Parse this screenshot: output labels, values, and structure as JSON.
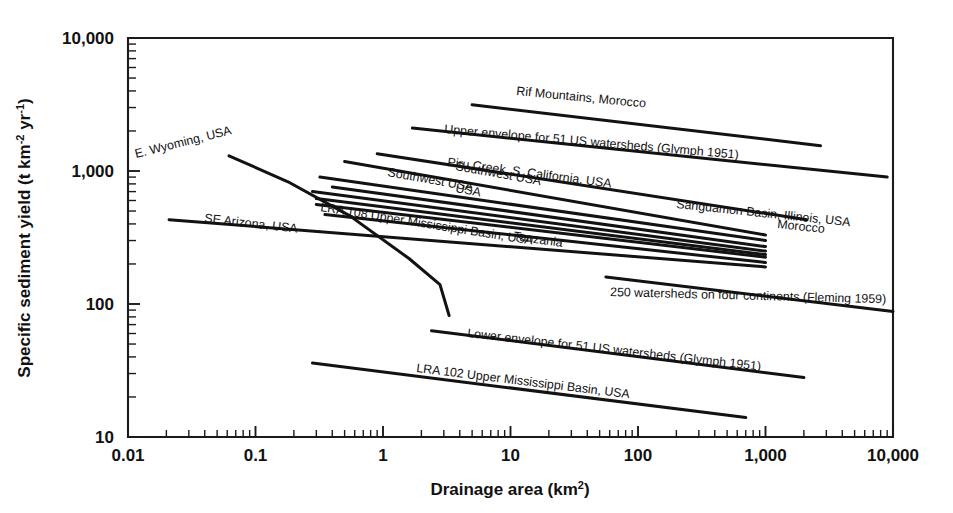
{
  "figure": {
    "title": "",
    "background": "#ffffff",
    "ink_color": "#121212"
  },
  "axes": {
    "x": {
      "label_prefix": "Drainage area (km",
      "label_sup": "2",
      "label_suffix": ")",
      "label_full": "Drainage area (km2)",
      "scale": "log",
      "min": 0.01,
      "max": 10000,
      "ticks": [
        {
          "value": 0.01,
          "label": "0.01"
        },
        {
          "value": 0.1,
          "label": "0.1"
        },
        {
          "value": 1,
          "label": "1"
        },
        {
          "value": 10,
          "label": "10"
        },
        {
          "value": 100,
          "label": "100"
        },
        {
          "value": 1000,
          "label": "1,000"
        },
        {
          "value": 10000,
          "label": "10,000"
        }
      ]
    },
    "y": {
      "label_part1": "Specific sediment yield (t km",
      "label_sup1": "-2",
      "label_part2": " yr",
      "label_sup2": "-1",
      "label_part3": ")",
      "label_full": "Specific sediment yield (t km-2 yr-1)",
      "scale": "log",
      "min": 10,
      "max": 10000,
      "ticks": [
        {
          "value": 10,
          "label": "10"
        },
        {
          "value": 100,
          "label": "100"
        },
        {
          "value": 1000,
          "label": "1,000"
        },
        {
          "value": 10000,
          "label": "10,000"
        }
      ]
    }
  },
  "chart_data": {
    "type": "line",
    "title": "",
    "xlabel": "Drainage area (km2)",
    "ylabel": "Specific sediment yield (t km-2 yr-1)",
    "xscale": "log",
    "yscale": "log",
    "xlim": [
      0.01,
      10000
    ],
    "ylim": [
      10,
      10000
    ],
    "grid": false,
    "legend": "inline-labels",
    "series": [
      {
        "name": "Rif Mountains, Morocco",
        "label": "Rif Mountains, Morocco",
        "label_angle": 5.5,
        "label_x": 516,
        "label_y": 95,
        "points": [
          [
            5.0,
            3150
          ],
          [
            2700,
            1550
          ]
        ]
      },
      {
        "name": "Upper envelope for 51 US watersheds (Glymph 1951)",
        "label": "Upper envelope for 51 US watersheds (Glymph 1951)",
        "label_angle": 5.0,
        "label_x": 444,
        "label_y": 133,
        "points": [
          [
            1.7,
            2100
          ],
          [
            9000,
            900
          ]
        ]
      },
      {
        "name": "Piru Creek, S. California, USA",
        "label": "Piru Creek, S. California, USA",
        "label_angle": 7.5,
        "label_x": 447,
        "label_y": 166,
        "points": [
          [
            0.9,
            1350
          ],
          [
            2100,
            430
          ]
        ]
      },
      {
        "name": "Southwest USA (upper)",
        "label": "Southwest USA",
        "label_angle": 10.0,
        "label_x": 387,
        "label_y": 176,
        "points": [
          [
            0.5,
            1180
          ],
          [
            1000,
            330
          ]
        ]
      },
      {
        "name": "Southwest USA (lower)",
        "label": "Southwest USA",
        "label_angle": 10.0,
        "label_x": 455,
        "label_y": 170,
        "points": [
          [
            0.32,
            900
          ],
          [
            1000,
            300
          ]
        ]
      },
      {
        "name": "USA",
        "label": "USA",
        "label_angle": 10.0,
        "label_x": 455,
        "label_y": 192,
        "points": [
          [
            0.4,
            760
          ],
          [
            1000,
            270
          ]
        ]
      },
      {
        "name": "Sanguamon Basin, Illinois, USA",
        "label": "Sanguamon Basin, Illinois, USA",
        "label_angle": 6.0,
        "label_x": 676,
        "label_y": 208,
        "points": [
          [
            0.28,
            700
          ],
          [
            1000,
            250
          ]
        ]
      },
      {
        "name": "LRA 108 Upper Mississippi Basin, USA",
        "label": "LRA 108 Upper Mississippi Basin, USA",
        "label_angle": 9.0,
        "label_x": 320,
        "label_y": 211,
        "points": [
          [
            0.3,
            620
          ],
          [
            1000,
            235
          ]
        ]
      },
      {
        "name": "Morocco",
        "label": "Morocco",
        "label_angle": 6.0,
        "label_x": 777,
        "label_y": 228,
        "points": [
          [
            0.3,
            560
          ],
          [
            1000,
            225
          ]
        ]
      },
      {
        "name": "Tanzania",
        "label": "Tanzania",
        "label_angle": 8.0,
        "label_x": 513,
        "label_y": 240,
        "points": [
          [
            0.35,
            470
          ],
          [
            1000,
            205
          ]
        ]
      },
      {
        "name": "E. Wyoming, USA",
        "label": "E. Wyoming, USA",
        "label_angle": -14.0,
        "label_x": 136,
        "label_y": 158,
        "points": [
          [
            0.062,
            1300
          ],
          [
            0.18,
            830
          ],
          [
            0.55,
            460
          ],
          [
            1.6,
            220
          ],
          [
            2.8,
            140
          ],
          [
            3.3,
            82
          ]
        ]
      },
      {
        "name": "SE Arizona, USA",
        "label": "SE Arizona, USA",
        "label_angle": 6.5,
        "label_x": 204,
        "label_y": 222,
        "points": [
          [
            0.021,
            430
          ],
          [
            1000,
            190
          ]
        ]
      },
      {
        "name": "250 watersheds on four continents (Fleming 1959)",
        "label": "250 watersheds on four continents (Fleming 1959)",
        "label_angle": 1.5,
        "label_x": 610,
        "label_y": 296,
        "points": [
          [
            56,
            160
          ],
          [
            10000,
            88
          ]
        ]
      },
      {
        "name": "Lower envelope for 51 US watersheds (Glymph 1951)",
        "label": "Lower envelope for 51 US watersheds (Glymph 1951)",
        "label_angle": 6.5,
        "label_x": 467,
        "label_y": 337,
        "points": [
          [
            2.4,
            63
          ],
          [
            2000,
            28
          ]
        ]
      },
      {
        "name": "LRA 102 Upper Mississippi Basin, USA",
        "label": "LRA 102 Upper Mississippi Basin, USA",
        "label_angle": 7.0,
        "label_x": 416,
        "label_y": 372,
        "points": [
          [
            0.28,
            36
          ],
          [
            700,
            14
          ]
        ]
      }
    ]
  }
}
